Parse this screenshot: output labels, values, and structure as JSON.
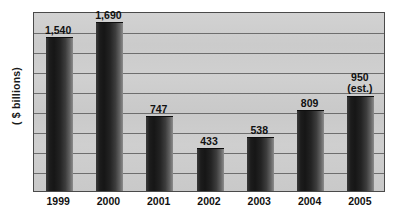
{
  "chart_data": {
    "type": "bar",
    "title": "",
    "subtitle": "",
    "xlabel": "",
    "ylabel": "( $ billions)",
    "categories": [
      "1999",
      "2000",
      "2001",
      "2002",
      "2003",
      "2004",
      "2005"
    ],
    "values": [
      1540,
      1690,
      747,
      433,
      538,
      809,
      950
    ],
    "value_labels": [
      "1,540",
      "1,690",
      "747",
      "433",
      "538",
      "809",
      "950"
    ],
    "annotations": [
      {
        "category": "2005",
        "text": "(est.)"
      }
    ],
    "ylim": [
      0,
      1800
    ],
    "gridlines": [
      200,
      400,
      600,
      800,
      1000,
      1200,
      1400,
      1600
    ],
    "grid": true,
    "legend": null,
    "legend_position": "none",
    "axis_tick_labels_y": [],
    "colors": {
      "bar_dark": "#161616",
      "bar_light": "#8d8d8d",
      "plot_background": "#cecece",
      "gridline": "#6e6e6e",
      "frame_border": "#4a4a4a",
      "text": "#111111",
      "page_background": "#ffffff"
    }
  },
  "axis": {
    "y_title": "( $ billions)"
  }
}
